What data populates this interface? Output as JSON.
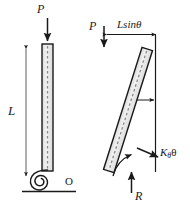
{
  "figure": {
    "canvas": {
      "width": 190,
      "height": 209
    },
    "colors": {
      "stroke": "#1a1a1a",
      "column_fill": "#e8e8e8",
      "centerline": "#8a8a8a",
      "background": "#ffffff"
    },
    "panels": [
      {
        "id": "undeformed",
        "name": "left-figure-undeformed-column",
        "labels": {
          "load": "P",
          "length": "L",
          "pivot": "O"
        },
        "elements": [
          "vertical-column",
          "load-arrow-down",
          "length-dimension-line",
          "spiral-torsion-spring",
          "ground-hatch-line",
          "pivot-point-label"
        ]
      },
      {
        "id": "deformed",
        "name": "right-figure-deflected-column",
        "labels": {
          "load": "P",
          "horizontal_offset": "Lsinθ",
          "spring_moment_K": "K",
          "spring_moment_sub": "θ",
          "spring_moment_theta": "θ",
          "reaction": "R"
        },
        "elements": [
          "tilted-column",
          "load-arrow-down",
          "lsin-theta-dimension-line",
          "vertical-reference-line",
          "rotation-curved-arrow",
          "spring-moment-arrow",
          "reaction-arrow-up"
        ]
      }
    ]
  }
}
